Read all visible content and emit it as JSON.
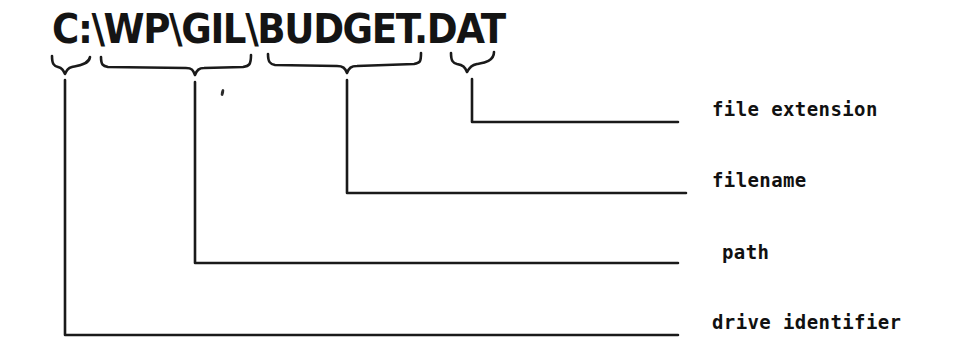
{
  "diagram": {
    "type": "annotated-path-breakdown",
    "title_text": "C:\\WP\\GIL\\BUDGET.DAT",
    "segments": [
      {
        "id": "drive",
        "text": "C:",
        "label": "drive identifier"
      },
      {
        "id": "path",
        "text": "\\WP\\GIL",
        "label": "path"
      },
      {
        "id": "filename",
        "text": "\\BUDGET",
        "label": "filename"
      },
      {
        "id": "extension",
        "text": ".DAT",
        "label": "file extension"
      }
    ],
    "labels": {
      "file_extension": "file extension",
      "filename": "filename",
      "path": "path",
      "drive_identifier": "drive identifier"
    },
    "colors": {
      "background": "#ffffff",
      "ink": "#141414",
      "line": "#1a1a1a"
    }
  }
}
